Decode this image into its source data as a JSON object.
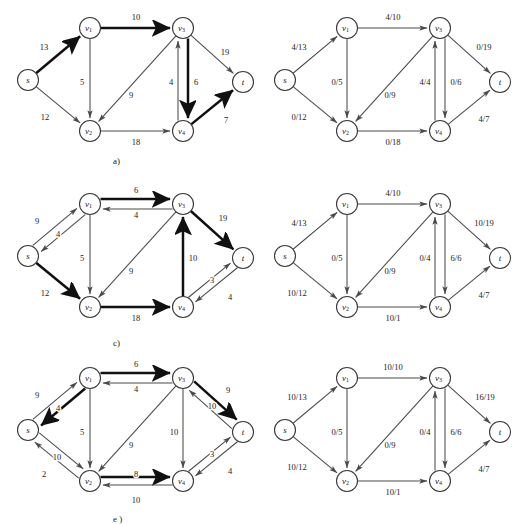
{
  "document": {
    "title": "Maximum Flow Network Figures",
    "background_color": "#ffffff",
    "ink_color": "#1a1a1a",
    "bold_ink_color": "#101010",
    "thin_ink_color": "#4a4a4a"
  },
  "node_positions": {
    "s": {
      "x": 28,
      "y": 80
    },
    "v1": {
      "x": 90,
      "y": 28
    },
    "v2": {
      "x": 90,
      "y": 131
    },
    "v3": {
      "x": 183,
      "y": 28
    },
    "v4": {
      "x": 183,
      "y": 131
    },
    "t": {
      "x": 243,
      "y": 82
    }
  },
  "node_names": {
    "s": {
      "base": "s",
      "sub": ""
    },
    "v1": {
      "base": "v",
      "sub": "1"
    },
    "v2": {
      "base": "v",
      "sub": "2"
    },
    "v3": {
      "base": "v",
      "sub": "3"
    },
    "v4": {
      "base": "v",
      "sub": "4"
    },
    "t": {
      "base": "t",
      "sub": ""
    }
  },
  "panels": [
    {
      "id": "a",
      "caption": "a)",
      "caption_x": 113,
      "caption_y": 156,
      "origin_x": 0,
      "origin_y": 0,
      "edges": [
        {
          "from": "s",
          "to": "v1",
          "label": "13",
          "bold": true,
          "lx": 44,
          "ly": 47,
          "curve": 0
        },
        {
          "from": "s",
          "to": "v2",
          "label": "12",
          "bold": false,
          "lx": 45,
          "ly": 117,
          "curve": 0
        },
        {
          "from": "v1",
          "to": "v2",
          "label": "5",
          "bold": false,
          "lx": 82,
          "ly": 82,
          "curve": 0
        },
        {
          "from": "v1",
          "to": "v3",
          "label": "10",
          "bold": true,
          "lx": 136,
          "ly": 17,
          "curve": 0
        },
        {
          "from": "v3",
          "to": "v2",
          "label": "9",
          "bold": false,
          "lx": 131,
          "ly": 95,
          "curve": 0
        },
        {
          "from": "v2",
          "to": "v4",
          "label": "18",
          "bold": false,
          "lx": 136,
          "ly": 142,
          "curve": 0
        },
        {
          "from": "v3",
          "to": "v4",
          "label": "4",
          "bold": true,
          "lx": 171,
          "ly": 82,
          "curve": -5
        },
        {
          "from": "v4",
          "to": "v3",
          "label": "6",
          "bold": false,
          "lx": 196,
          "ly": 82,
          "curve": -5
        },
        {
          "from": "v3",
          "to": "t",
          "label": "19",
          "bold": false,
          "lx": 225,
          "ly": 52,
          "curve": 0
        },
        {
          "from": "v4",
          "to": "t",
          "label": "7",
          "bold": true,
          "lx": 226,
          "ly": 120,
          "curve": 0
        }
      ]
    },
    {
      "id": "b",
      "caption": "b)",
      "caption_x": 374,
      "caption_y": 156,
      "origin_x": 257,
      "origin_y": 0,
      "edges": [
        {
          "from": "s",
          "to": "v1",
          "label": "4/13",
          "bold": false,
          "lx": 42,
          "ly": 47,
          "curve": 0
        },
        {
          "from": "s",
          "to": "v2",
          "label": "0/12",
          "bold": false,
          "lx": 42,
          "ly": 117,
          "curve": 0
        },
        {
          "from": "v1",
          "to": "v2",
          "label": "0/5",
          "bold": false,
          "lx": 80,
          "ly": 82,
          "curve": 0
        },
        {
          "from": "v1",
          "to": "v3",
          "label": "4/10",
          "bold": false,
          "lx": 136,
          "ly": 17,
          "curve": 0
        },
        {
          "from": "v3",
          "to": "v2",
          "label": "0/9",
          "bold": false,
          "lx": 133,
          "ly": 95,
          "curve": 0
        },
        {
          "from": "v2",
          "to": "v4",
          "label": "0/18",
          "bold": false,
          "lx": 136,
          "ly": 142,
          "curve": 0
        },
        {
          "from": "v3",
          "to": "v4",
          "label": "4/4",
          "bold": false,
          "lx": 168,
          "ly": 82,
          "curve": -5
        },
        {
          "from": "v4",
          "to": "v3",
          "label": "0/6",
          "bold": false,
          "lx": 199,
          "ly": 82,
          "curve": -5
        },
        {
          "from": "v3",
          "to": "t",
          "label": "0/19",
          "bold": false,
          "lx": 227,
          "ly": 47,
          "curve": 0
        },
        {
          "from": "v4",
          "to": "t",
          "label": "4/7",
          "bold": false,
          "lx": 227,
          "ly": 119,
          "curve": 0
        }
      ]
    },
    {
      "id": "c",
      "caption": "c)",
      "caption_x": 113,
      "caption_y": 162,
      "origin_x": 0,
      "origin_y": 176,
      "edges": [
        {
          "from": "v1",
          "to": "s",
          "label": "9",
          "bold": false,
          "lx": 37,
          "ly": 45,
          "curve": -5
        },
        {
          "from": "s",
          "to": "v1",
          "label": "4",
          "bold": false,
          "lx": 58,
          "ly": 58,
          "curve": -5
        },
        {
          "from": "s",
          "to": "v2",
          "label": "12",
          "bold": true,
          "lx": 45,
          "ly": 117,
          "curve": 0
        },
        {
          "from": "v1",
          "to": "v2",
          "label": "5",
          "bold": false,
          "lx": 82,
          "ly": 82,
          "curve": 0
        },
        {
          "from": "v1",
          "to": "v3",
          "label": "6",
          "bold": true,
          "lx": 136,
          "ly": 14,
          "curve": -5
        },
        {
          "from": "v3",
          "to": "v1",
          "label": "4",
          "bold": false,
          "lx": 136,
          "ly": 39,
          "curve": -5
        },
        {
          "from": "v3",
          "to": "v2",
          "label": "9",
          "bold": false,
          "lx": 131,
          "ly": 95,
          "curve": 0
        },
        {
          "from": "v2",
          "to": "v4",
          "label": "18",
          "bold": true,
          "lx": 136,
          "ly": 142,
          "curve": 0
        },
        {
          "from": "v4",
          "to": "v3",
          "label": "10",
          "bold": true,
          "lx": 193,
          "ly": 82,
          "curve": 0
        },
        {
          "from": "v3",
          "to": "t",
          "label": "19",
          "bold": true,
          "lx": 223,
          "ly": 42,
          "curve": 0
        },
        {
          "from": "v4",
          "to": "t",
          "label": "3",
          "bold": false,
          "lx": 212,
          "ly": 104,
          "curve": -4
        },
        {
          "from": "t",
          "to": "v4",
          "label": "4",
          "bold": false,
          "lx": 230,
          "ly": 121,
          "curve": -4
        }
      ]
    },
    {
      "id": "d",
      "caption": "d)",
      "caption_x": 374,
      "caption_y": 162,
      "origin_x": 257,
      "origin_y": 176,
      "edges": [
        {
          "from": "s",
          "to": "v1",
          "label": "4/13",
          "bold": false,
          "lx": 42,
          "ly": 47,
          "curve": 0
        },
        {
          "from": "s",
          "to": "v2",
          "label": "10/12",
          "bold": false,
          "lx": 40,
          "ly": 117,
          "curve": 0
        },
        {
          "from": "v1",
          "to": "v2",
          "label": "0/5",
          "bold": false,
          "lx": 80,
          "ly": 82,
          "curve": 0
        },
        {
          "from": "v1",
          "to": "v3",
          "label": "4/10",
          "bold": false,
          "lx": 136,
          "ly": 17,
          "curve": 0
        },
        {
          "from": "v3",
          "to": "v2",
          "label": "0/9",
          "bold": false,
          "lx": 133,
          "ly": 95,
          "curve": 0
        },
        {
          "from": "v2",
          "to": "v4",
          "label": "10/1",
          "bold": false,
          "lx": 136,
          "ly": 142,
          "curve": 0
        },
        {
          "from": "v3",
          "to": "v4",
          "label": "0/4",
          "bold": false,
          "lx": 168,
          "ly": 82,
          "curve": -5
        },
        {
          "from": "v4",
          "to": "v3",
          "label": "6/6",
          "bold": false,
          "lx": 199,
          "ly": 82,
          "curve": -5
        },
        {
          "from": "v3",
          "to": "t",
          "label": "10/19",
          "bold": false,
          "lx": 227,
          "ly": 47,
          "curve": 0
        },
        {
          "from": "v4",
          "to": "t",
          "label": "4/7",
          "bold": false,
          "lx": 227,
          "ly": 119,
          "curve": 0
        }
      ]
    },
    {
      "id": "e",
      "caption": "e )",
      "caption_x": 113,
      "caption_y": 164,
      "origin_x": 0,
      "origin_y": 350,
      "edges": [
        {
          "from": "v1",
          "to": "s",
          "label": "9",
          "bold": true,
          "lx": 37,
          "ly": 45,
          "curve": -5
        },
        {
          "from": "s",
          "to": "v1",
          "label": "4",
          "bold": false,
          "lx": 58,
          "ly": 58,
          "curve": -5
        },
        {
          "from": "v2",
          "to": "s",
          "label": "10",
          "bold": false,
          "lx": 57,
          "ly": 107,
          "curve": -5
        },
        {
          "from": "s",
          "to": "v2",
          "label": "2",
          "bold": false,
          "lx": 44,
          "ly": 124,
          "curve": -5
        },
        {
          "from": "v1",
          "to": "v2",
          "label": "5",
          "bold": false,
          "lx": 82,
          "ly": 82,
          "curve": 0
        },
        {
          "from": "v1",
          "to": "v3",
          "label": "6",
          "bold": true,
          "lx": 136,
          "ly": 14,
          "curve": -5
        },
        {
          "from": "v3",
          "to": "v1",
          "label": "4",
          "bold": false,
          "lx": 136,
          "ly": 39,
          "curve": -5
        },
        {
          "from": "v3",
          "to": "v2",
          "label": "9",
          "bold": false,
          "lx": 131,
          "ly": 95,
          "curve": 0
        },
        {
          "from": "v2",
          "to": "v4",
          "label": "8",
          "bold": true,
          "lx": 136,
          "ly": 124,
          "curve": -4
        },
        {
          "from": "v4",
          "to": "v2",
          "label": "10",
          "bold": false,
          "lx": 136,
          "ly": 150,
          "curve": -4
        },
        {
          "from": "v3",
          "to": "v4",
          "label": "10",
          "bold": false,
          "lx": 174,
          "ly": 82,
          "curve": 0
        },
        {
          "from": "v3",
          "to": "t",
          "label": "9",
          "bold": true,
          "lx": 228,
          "ly": 40,
          "curve": -5
        },
        {
          "from": "t",
          "to": "v3",
          "label": "10",
          "bold": false,
          "lx": 212,
          "ly": 56,
          "curve": -5
        },
        {
          "from": "v4",
          "to": "t",
          "label": "3",
          "bold": false,
          "lx": 212,
          "ly": 104,
          "curve": -4
        },
        {
          "from": "t",
          "to": "v4",
          "label": "4",
          "bold": false,
          "lx": 230,
          "ly": 121,
          "curve": -4
        }
      ]
    },
    {
      "id": "f",
      "caption": "f )",
      "caption_x": 374,
      "caption_y": 164,
      "origin_x": 257,
      "origin_y": 350,
      "edges": [
        {
          "from": "s",
          "to": "v1",
          "label": "10/13",
          "bold": false,
          "lx": 40,
          "ly": 47,
          "curve": 0
        },
        {
          "from": "s",
          "to": "v2",
          "label": "10/12",
          "bold": false,
          "lx": 40,
          "ly": 117,
          "curve": 0
        },
        {
          "from": "v1",
          "to": "v2",
          "label": "0/5",
          "bold": false,
          "lx": 80,
          "ly": 82,
          "curve": 0
        },
        {
          "from": "v1",
          "to": "v3",
          "label": "10/10",
          "bold": false,
          "lx": 136,
          "ly": 17,
          "curve": 0
        },
        {
          "from": "v3",
          "to": "v2",
          "label": "0/9",
          "bold": false,
          "lx": 133,
          "ly": 95,
          "curve": 0
        },
        {
          "from": "v2",
          "to": "v4",
          "label": "10/1",
          "bold": false,
          "lx": 136,
          "ly": 142,
          "curve": 0
        },
        {
          "from": "v3",
          "to": "v4",
          "label": "0/4",
          "bold": false,
          "lx": 168,
          "ly": 82,
          "curve": -5
        },
        {
          "from": "v4",
          "to": "v3",
          "label": "6/6",
          "bold": false,
          "lx": 199,
          "ly": 82,
          "curve": -5
        },
        {
          "from": "v3",
          "to": "t",
          "label": "16/19",
          "bold": false,
          "lx": 228,
          "ly": 47,
          "curve": 0
        },
        {
          "from": "v4",
          "to": "t",
          "label": "4/7",
          "bold": false,
          "lx": 227,
          "ly": 119,
          "curve": 0
        }
      ]
    }
  ]
}
